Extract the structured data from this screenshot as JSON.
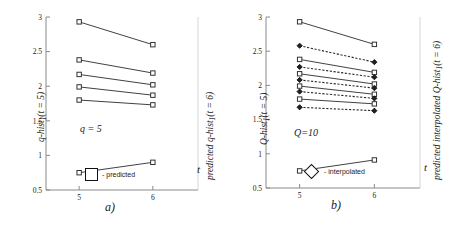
{
  "figure": {
    "panels": [
      {
        "caption": "a)",
        "annotation": "q = 5",
        "y_axis_label_left": "q-hist₁(t = 5)",
        "y_axis_label_right": "predicted  q-hist₁(t = 6)",
        "x_axis_label": "t",
        "legend": [
          {
            "marker": "square",
            "label": "- predicted"
          }
        ]
      },
      {
        "caption": "b)",
        "annotation": "Q=10",
        "y_axis_label_left": "Q-hist₁(t = 5)",
        "y_axis_label_right": "predicted  interpolated  Q-hist₁(t = 6)",
        "x_axis_label": "t",
        "legend": [
          {
            "marker": "diamond",
            "label": "- interpolated"
          }
        ]
      }
    ]
  },
  "chart_data": [
    {
      "type": "line",
      "title": "a)",
      "xlabel": "t",
      "ylabel": "q-hist₁(t = 5)",
      "ylabel_right": "predicted q-hist₁(t = 6)",
      "annotation": "q = 5",
      "x": [
        5,
        6
      ],
      "xlim": [
        4.55,
        6.45
      ],
      "ylim": [
        0.5,
        3
      ],
      "xticks": [
        5,
        6
      ],
      "xticklabels": [
        "5",
        "6"
      ],
      "yticks": [
        0.5,
        1,
        1.5,
        2,
        2.5,
        3
      ],
      "yticklabels": [
        "0.5",
        "1",
        "1.5",
        "2",
        "2.5",
        "3"
      ],
      "grid": false,
      "legend": [
        "- predicted"
      ],
      "legend_position": "bottom-center",
      "marker": "square",
      "linestyle": "solid",
      "color": "#1a1a1a",
      "series": [
        {
          "name": "s1",
          "values": [
            2.93,
            2.6
          ]
        },
        {
          "name": "s2",
          "values": [
            2.38,
            2.19
          ]
        },
        {
          "name": "s3",
          "values": [
            2.17,
            2.02
          ]
        },
        {
          "name": "s4",
          "values": [
            1.99,
            1.87
          ]
        },
        {
          "name": "s5",
          "values": [
            1.8,
            1.73
          ]
        },
        {
          "name": "s6",
          "values": [
            0.75,
            0.9
          ]
        }
      ]
    },
    {
      "type": "line",
      "title": "b)",
      "xlabel": "t",
      "ylabel": "Q-hist₁(t = 5)",
      "ylabel_right": "predicted interpolated Q-hist₁(t = 6)",
      "annotation": "Q=10",
      "x": [
        5,
        6
      ],
      "xlim": [
        4.55,
        6.45
      ],
      "ylim": [
        0.5,
        3
      ],
      "xticks": [
        5,
        6
      ],
      "xticklabels": [
        "5",
        "6"
      ],
      "yticks": [
        0.5,
        1,
        1.5,
        2,
        2.5,
        3
      ],
      "yticklabels": [
        "0.5",
        "1",
        "1.5",
        "2",
        "2.5",
        "3"
      ],
      "grid": false,
      "legend": [
        "- interpolated"
      ],
      "legend_position": "bottom-center",
      "color": "#1a1a1a",
      "series": [
        {
          "name": "p1",
          "marker": "square",
          "linestyle": "solid",
          "values": [
            2.93,
            2.6
          ]
        },
        {
          "name": "i1",
          "marker": "diamond",
          "linestyle": "dashed",
          "values": [
            2.58,
            2.34
          ]
        },
        {
          "name": "p2",
          "marker": "square",
          "linestyle": "solid",
          "values": [
            2.38,
            2.19
          ]
        },
        {
          "name": "i2",
          "marker": "diamond",
          "linestyle": "dashed",
          "values": [
            2.27,
            2.12
          ]
        },
        {
          "name": "p3",
          "marker": "square",
          "linestyle": "solid",
          "values": [
            2.17,
            2.02
          ]
        },
        {
          "name": "i3",
          "marker": "diamond",
          "linestyle": "dashed",
          "values": [
            2.08,
            1.96
          ]
        },
        {
          "name": "p4",
          "marker": "square",
          "linestyle": "solid",
          "values": [
            1.99,
            1.87
          ]
        },
        {
          "name": "i4",
          "marker": "diamond",
          "linestyle": "dashed",
          "values": [
            1.91,
            1.81
          ]
        },
        {
          "name": "p5",
          "marker": "square",
          "linestyle": "solid",
          "values": [
            1.8,
            1.73
          ]
        },
        {
          "name": "i5",
          "marker": "diamond",
          "linestyle": "dashed",
          "values": [
            1.68,
            1.63
          ]
        },
        {
          "name": "p6",
          "marker": "square",
          "linestyle": "solid",
          "values": [
            0.75,
            0.91
          ]
        }
      ]
    }
  ]
}
